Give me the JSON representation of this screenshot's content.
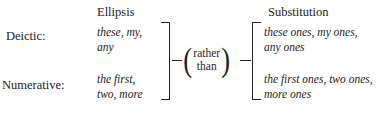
{
  "figure": {
    "columns": {
      "ellipsis_heading": "Ellipsis",
      "substitution_heading": "Substitution"
    },
    "rows": [
      {
        "label": "Deictic:",
        "ellipsis_line1": "these, my,",
        "ellipsis_line2": "any",
        "substitution_line1": "these ones, my ones,",
        "substitution_line2": "any ones"
      },
      {
        "label": "Numerative:",
        "ellipsis_line1": "the first,",
        "ellipsis_line2": "two, more",
        "substitution_line1": "the first ones, two ones,",
        "substitution_line2": "more ones"
      }
    ],
    "connector": {
      "open_paren": "(",
      "close_paren": ")",
      "line1": "rather",
      "line2": "than"
    },
    "colors": {
      "background": "#ffffff",
      "text": "#1b1b1b",
      "rule": "#222222"
    }
  }
}
